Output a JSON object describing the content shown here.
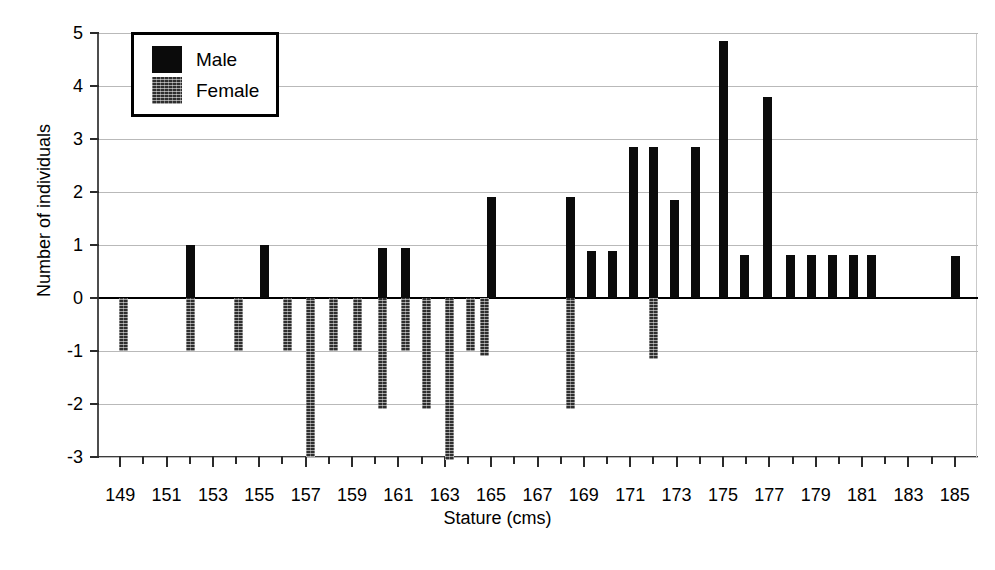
{
  "chart_data": {
    "type": "bar",
    "title": "",
    "subtitle": "",
    "xlabel": "Stature (cms)",
    "ylabel": "Number of individuals",
    "xlim": [
      148,
      186
    ],
    "ylim": [
      -3,
      5
    ],
    "yticks": [
      5,
      4,
      3,
      2,
      1,
      0,
      -1,
      -2,
      -3
    ],
    "ytick_labels": [
      "5",
      "4",
      "3",
      "2",
      "1",
      "0",
      "-1",
      "-2",
      "-3"
    ],
    "xticks": [
      149,
      151,
      153,
      155,
      157,
      159,
      161,
      163,
      165,
      167,
      169,
      171,
      173,
      175,
      177,
      179,
      181,
      183,
      185
    ],
    "xtick_labels": [
      "149",
      "151",
      "153",
      "155",
      "157",
      "159",
      "161",
      "163",
      "165",
      "167",
      "169",
      "171",
      "173",
      "175",
      "177",
      "179",
      "181",
      "183",
      "185"
    ],
    "grid": true,
    "grid_axis": "y",
    "legend_position": "upper-left",
    "note": "Back-to-back population pyramid histogram: Male counts plotted upward (positive), Female counts plotted downward (negative).",
    "series": [
      {
        "name": "Male",
        "color": "#0b0b0b",
        "direction": "up",
        "points": [
          {
            "x": 152,
            "y": 1.0
          },
          {
            "x": 155.2,
            "y": 1.0
          },
          {
            "x": 160.3,
            "y": 0.95
          },
          {
            "x": 161.3,
            "y": 0.95
          },
          {
            "x": 165.0,
            "y": 1.9
          },
          {
            "x": 168.4,
            "y": 1.9
          },
          {
            "x": 169.3,
            "y": 0.88
          },
          {
            "x": 170.2,
            "y": 0.88
          },
          {
            "x": 171.1,
            "y": 2.85
          },
          {
            "x": 172.0,
            "y": 2.85
          },
          {
            "x": 172.9,
            "y": 1.85
          },
          {
            "x": 173.8,
            "y": 2.85
          },
          {
            "x": 175.0,
            "y": 4.85
          },
          {
            "x": 175.9,
            "y": 0.82
          },
          {
            "x": 176.9,
            "y": 3.8
          },
          {
            "x": 177.9,
            "y": 0.82
          },
          {
            "x": 178.8,
            "y": 0.82
          },
          {
            "x": 179.7,
            "y": 0.82
          },
          {
            "x": 180.6,
            "y": 0.82
          },
          {
            "x": 181.4,
            "y": 0.82
          },
          {
            "x": 185.0,
            "y": 0.8
          }
        ]
      },
      {
        "name": "Female",
        "color": "#2e2e2e",
        "direction": "down",
        "points": [
          {
            "x": 149.1,
            "y": -1.0
          },
          {
            "x": 152.0,
            "y": -1.0
          },
          {
            "x": 154.1,
            "y": -1.0
          },
          {
            "x": 156.2,
            "y": -1.0
          },
          {
            "x": 157.2,
            "y": -3.0
          },
          {
            "x": 158.2,
            "y": -1.0
          },
          {
            "x": 159.2,
            "y": -1.0
          },
          {
            "x": 160.3,
            "y": -2.1
          },
          {
            "x": 161.3,
            "y": -1.0
          },
          {
            "x": 162.2,
            "y": -2.1
          },
          {
            "x": 163.2,
            "y": -3.05
          },
          {
            "x": 164.1,
            "y": -1.0
          },
          {
            "x": 164.7,
            "y": -1.1
          },
          {
            "x": 168.4,
            "y": -2.1
          },
          {
            "x": 172.0,
            "y": -1.15
          }
        ]
      }
    ]
  },
  "legend": {
    "items": [
      {
        "label": "Male",
        "swatch": "male"
      },
      {
        "label": "Female",
        "swatch": "female"
      }
    ]
  }
}
